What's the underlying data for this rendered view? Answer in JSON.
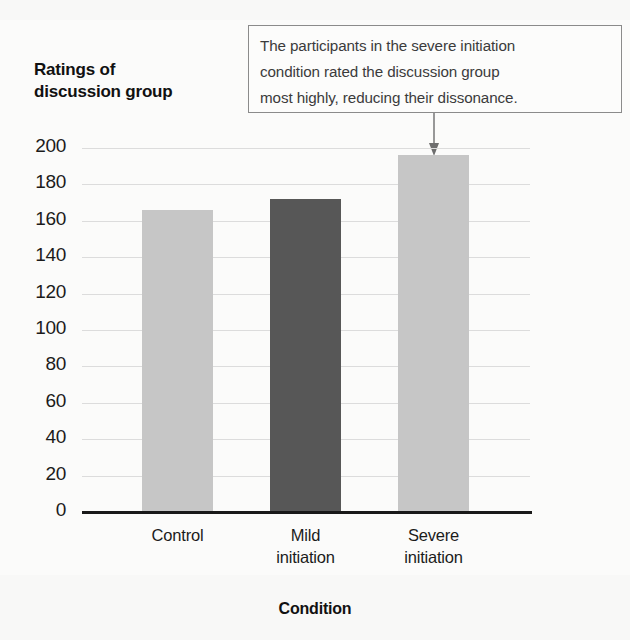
{
  "callout": {
    "text": "The participants in the severe initiation\ncondition rated the discussion group\nmost highly, reducing their dissonance.",
    "arrow_target": "Severe initiation"
  },
  "axes": {
    "y_title": "Ratings of\ndiscussion group",
    "x_title": "Condition",
    "y_ticks": [
      "200",
      "180",
      "160",
      "140",
      "120",
      "100",
      "80",
      "60",
      "40",
      "20",
      "0"
    ]
  },
  "chart_data": {
    "type": "bar",
    "title": "",
    "subtitle": "",
    "xlabel": "Condition",
    "ylabel": "Ratings of discussion group",
    "categories": [
      "Control",
      "Mild\ninitiation",
      "Severe\ninitiation"
    ],
    "category_labels_flat": [
      "Control",
      "Mild initiation",
      "Severe initiation"
    ],
    "values": [
      166,
      172,
      196
    ],
    "ylim": [
      0,
      200
    ],
    "ytick_step": 20,
    "yticks": [
      0,
      20,
      40,
      60,
      80,
      100,
      120,
      140,
      160,
      180,
      200
    ],
    "grid": true,
    "grid_axis": "y",
    "legend": false,
    "bar_colors": [
      "#c6c6c6",
      "#575757",
      "#c6c6c6"
    ],
    "annotations": [
      {
        "text": "The participants in the severe initiation condition rated the discussion group most highly, reducing their dissonance.",
        "points_to": "Severe initiation"
      }
    ]
  },
  "colors": {
    "bar_light": "#c6c6c6",
    "bar_dark": "#575757",
    "gridline": "#dcdcdc",
    "axis": "#191919",
    "callout_border": "#8b8b8b",
    "background": "#fbfbfa"
  }
}
